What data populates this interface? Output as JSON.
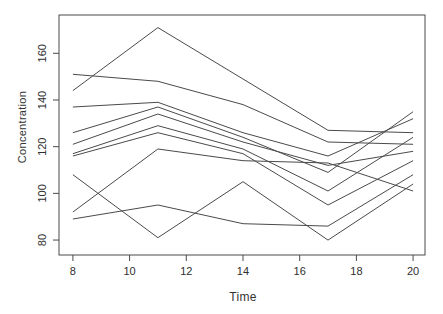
{
  "figure": {
    "background": "#ffffff",
    "line_color": "#4a4a4a",
    "axis_color": "#4a4a4a",
    "text_color": "#333333"
  },
  "chart_data": {
    "type": "line",
    "title": "",
    "xlabel": "Time",
    "ylabel": "Concentration",
    "x": [
      8,
      11,
      14,
      17,
      20
    ],
    "x_ticks": [
      8,
      10,
      12,
      14,
      16,
      18,
      20
    ],
    "y_ticks": [
      80,
      100,
      120,
      140,
      160
    ],
    "xlim": [
      7.51,
      20.42
    ],
    "ylim": [
      73.6,
      176.4
    ],
    "grid": false,
    "legend": "none",
    "series": [
      {
        "name": "subject-1",
        "values": [
          151,
          148,
          138,
          122,
          121
        ]
      },
      {
        "name": "subject-2",
        "values": [
          144,
          171,
          149,
          127,
          126
        ]
      },
      {
        "name": "subject-3",
        "values": [
          137,
          139,
          126,
          116,
          132
        ]
      },
      {
        "name": "subject-4",
        "values": [
          126,
          137,
          124,
          109,
          135
        ]
      },
      {
        "name": "subject-5",
        "values": [
          121,
          134,
          122,
          112,
          118
        ]
      },
      {
        "name": "subject-6",
        "values": [
          117,
          129,
          119,
          101,
          124
        ]
      },
      {
        "name": "subject-7",
        "values": [
          116,
          126,
          117,
          95,
          114
        ]
      },
      {
        "name": "subject-8",
        "values": [
          108,
          81,
          105,
          80,
          104
        ]
      },
      {
        "name": "subject-9",
        "values": [
          92,
          119,
          114,
          113,
          101
        ]
      },
      {
        "name": "subject-10",
        "values": [
          89,
          95,
          87,
          86,
          108
        ]
      }
    ]
  }
}
